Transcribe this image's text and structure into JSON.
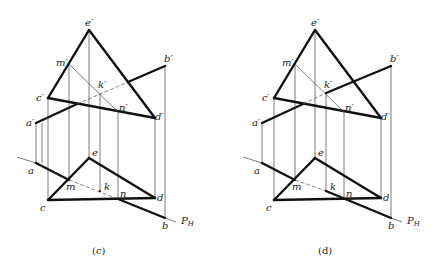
{
  "figure": {
    "panels": [
      {
        "id": "c",
        "caption": "(c)",
        "offset_x": 0,
        "labels": {
          "e_prime": "e′",
          "m_prime": "m′",
          "b_prime": "b′",
          "c_prime": "c′",
          "k_prime": "k′",
          "n_prime": "n′",
          "a_prime": "a′",
          "d_prime": "d′",
          "a": "a",
          "e": "e",
          "m": "m",
          "k": "k",
          "n": "n",
          "c": "c",
          "d": "d",
          "b": "b",
          "trace": "P",
          "trace_sub": "H"
        },
        "visibility": "a′b′ hidden from c′d′ crossing through k′ to e′d′ crossing; mn hidden in plan"
      },
      {
        "id": "d",
        "caption": "(d)",
        "offset_x": 220,
        "labels": {
          "e_prime": "e′",
          "m_prime": "m′",
          "b_prime": "b′",
          "c_prime": "c′",
          "k_prime": "k′",
          "n_prime": "n′",
          "a_prime": "a′",
          "d_prime": "d′",
          "a": "a",
          "e": "e",
          "m": "m",
          "k": "k",
          "n": "n",
          "c": "c",
          "d": "d",
          "b": "b",
          "trace": "P",
          "trace_sub": "H"
        },
        "visibility": "a′b′ hidden only from c′d′ crossing to k′; plan mk hidden, kn visible"
      }
    ],
    "points_front": {
      "e_prime": [
        89,
        30
      ],
      "m_prime": [
        69,
        64
      ],
      "c_prime": [
        48,
        98
      ],
      "d_prime": [
        155,
        118
      ],
      "b_prime": [
        165,
        66
      ],
      "a_prime": [
        36,
        123
      ],
      "k_prime": [
        100,
        93
      ],
      "n_prime": [
        118,
        112
      ]
    },
    "points_plan": {
      "a": [
        36,
        163
      ],
      "e": [
        89,
        158
      ],
      "m": [
        69,
        180
      ],
      "k": [
        100,
        191
      ],
      "n": [
        118,
        199
      ],
      "c": [
        48,
        200
      ],
      "d": [
        155,
        198
      ],
      "b": [
        165,
        218
      ]
    },
    "trace_line": {
      "from": [
        17,
        157
      ],
      "to": [
        176,
        207
      ]
    }
  }
}
